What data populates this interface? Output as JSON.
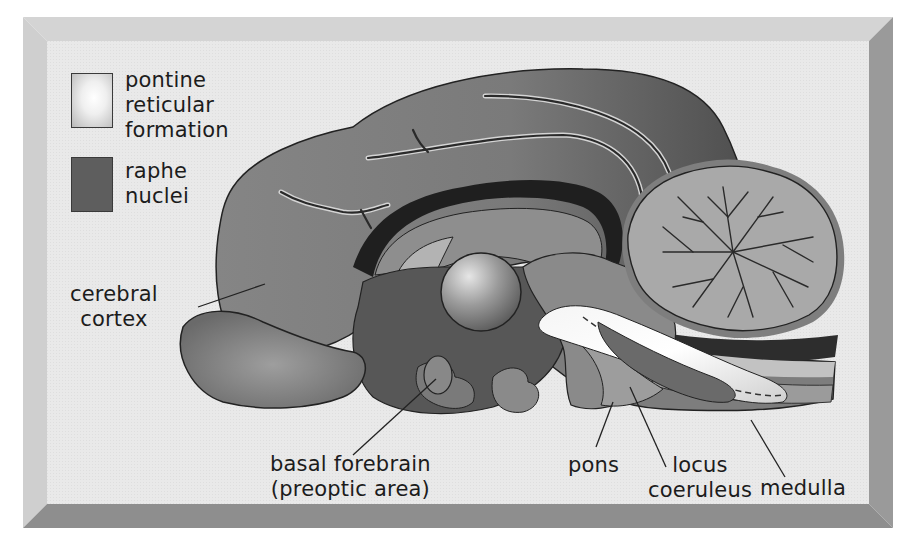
{
  "figure": {
    "kind": "sagittal brain section diagram",
    "colors": {
      "frame_outer": "#d8d8d8",
      "frame_bevel_light": "#cdcdcd",
      "frame_bevel_dark": "#8c8c8c",
      "panel_bg": "#ececec",
      "cortex_fill": "#8a8a8a",
      "cortex_dark": "#5d5d5d",
      "raphe_fill": "#5f5f5f",
      "pontine_fill": "#f2f2f2",
      "cerebellum_fill": "#a8a8a8",
      "outline": "#222222"
    }
  },
  "legend": {
    "items": [
      {
        "id": "pontine",
        "lines": [
          "pontine",
          "reticular",
          "formation"
        ],
        "swatch": "light-gradient"
      },
      {
        "id": "raphe",
        "lines": [
          "raphe",
          "nuclei"
        ],
        "swatch": "dark-gray"
      }
    ]
  },
  "labels": {
    "cerebral_cortex": [
      "cerebral",
      "cortex"
    ],
    "basal_forebrain": [
      "basal forebrain",
      "(preoptic area)"
    ],
    "pons": [
      "pons"
    ],
    "locus_coeruleus": [
      "locus",
      "coeruleus"
    ],
    "medulla": [
      "medulla"
    ]
  }
}
